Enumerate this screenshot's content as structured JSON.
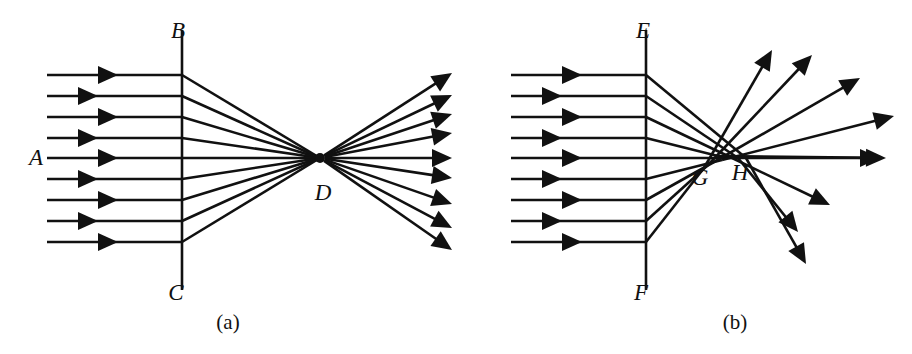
{
  "figure": {
    "width": 912,
    "height": 354,
    "background": "#ffffff",
    "ink_color": "#111111"
  },
  "panels": [
    {
      "id": "a",
      "caption": "(a)",
      "caption_x": 228,
      "caption_y": 322,
      "labels": [
        {
          "name": "beam-label-a",
          "text": "A",
          "x": 36,
          "y": 157
        },
        {
          "name": "surface-top-label-b",
          "text": "B",
          "x": 178,
          "y": 30
        },
        {
          "name": "surface-bottom-label-c",
          "text": "C",
          "x": 176,
          "y": 292
        },
        {
          "name": "focus-label-d",
          "text": "D",
          "x": 323,
          "y": 192
        }
      ],
      "surface": {
        "name": "surface-bc",
        "x": 182,
        "y_top": 30,
        "y_bottom": 290
      },
      "focus": {
        "name": "focal-point-d",
        "x": 320,
        "y": 158,
        "radius": 5
      },
      "incoming_rays": {
        "start_x": 47,
        "end_x": 182,
        "y_values": [
          75,
          96,
          117,
          138,
          158,
          179,
          200,
          221,
          242
        ],
        "arrow_x": [
          118,
          98,
          118,
          98,
          118,
          98,
          118,
          98,
          118
        ]
      },
      "outgoing_rays": {
        "end_x": 452,
        "end_y_values": [
          73,
          95,
          114,
          133,
          158,
          178,
          204,
          228,
          250
        ]
      }
    },
    {
      "id": "b",
      "caption": "(b)",
      "caption_x": 735,
      "caption_y": 322,
      "labels": [
        {
          "name": "surface-top-label-e",
          "text": "E",
          "x": 643,
          "y": 30
        },
        {
          "name": "surface-bottom-label-f",
          "text": "F",
          "x": 641,
          "y": 292
        },
        {
          "name": "crossing-label-g",
          "text": "G",
          "x": 700,
          "y": 177
        },
        {
          "name": "crossing-label-h",
          "text": "H",
          "x": 740,
          "y": 172
        }
      ],
      "surface": {
        "name": "surface-ef",
        "x": 646,
        "y_top": 30,
        "y_bottom": 290
      },
      "incoming_rays": {
        "start_x": 511,
        "end_x": 646,
        "y_values": [
          75,
          96,
          117,
          138,
          158,
          179,
          200,
          221,
          242
        ],
        "arrow_x": [
          582,
          562,
          582,
          562,
          582,
          562,
          582,
          562,
          582
        ]
      },
      "crossings": [
        {
          "x": 746,
          "y": 158
        },
        {
          "x": 738,
          "y": 158
        },
        {
          "x": 730,
          "y": 157
        },
        {
          "x": 718,
          "y": 156
        },
        {
          "x": 752,
          "y": 158
        },
        {
          "x": 722,
          "y": 160
        },
        {
          "x": 714,
          "y": 162
        },
        {
          "x": 708,
          "y": 165
        },
        {
          "x": 704,
          "y": 168
        }
      ],
      "outgoing_rays": {
        "end_points": [
          {
            "x": 806,
            "y": 264
          },
          {
            "x": 798,
            "y": 232
          },
          {
            "x": 830,
            "y": 205
          },
          {
            "x": 886,
            "y": 158
          },
          {
            "x": 880,
            "y": 158
          },
          {
            "x": 894,
            "y": 116
          },
          {
            "x": 860,
            "y": 78
          },
          {
            "x": 812,
            "y": 55
          },
          {
            "x": 772,
            "y": 50
          }
        ]
      }
    }
  ],
  "style": {
    "ray_stroke_width": 2.6,
    "surface_stroke_width": 2.6,
    "arrowhead_length": 20,
    "arrowhead_half_width": 9
  }
}
